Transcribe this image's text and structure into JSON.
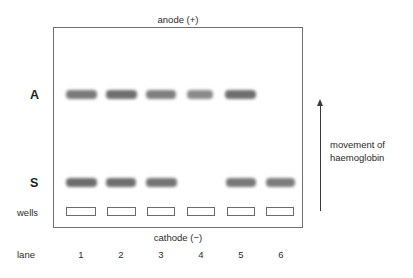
{
  "figure": {
    "type": "gel-electrophoresis-diagram",
    "anode_label": "anode (+)",
    "cathode_label": "cathode (−)",
    "wells_label": "wells",
    "lane_label": "lane",
    "row_labels": {
      "a": "A",
      "s": "S"
    },
    "movement_arrow": {
      "line1": "movement of",
      "line2": "haemoglobin",
      "direction": "up"
    },
    "lane_numbers": [
      "1",
      "2",
      "3",
      "4",
      "5",
      "6"
    ],
    "colors": {
      "band": "#848484",
      "band_dark": "#6e6e6e",
      "box_border": "#6f6f6f",
      "well_border": "#6b6b6b",
      "text": "#2e2a28",
      "arrow": "#3a3a3a",
      "background": "#ffffff"
    }
  },
  "chart_data": {
    "type": "table",
    "xlabel": "lane",
    "ylabel": "movement of haemoglobin",
    "categories": [
      "1",
      "2",
      "3",
      "4",
      "5",
      "6"
    ],
    "rows": [
      "A",
      "S",
      "wells"
    ],
    "series": [
      {
        "name": "A",
        "values": [
          1,
          1,
          1,
          1,
          1,
          0
        ]
      },
      {
        "name": "S",
        "values": [
          1,
          1,
          1,
          0,
          1,
          1
        ]
      },
      {
        "name": "wells",
        "values": [
          1,
          1,
          1,
          1,
          1,
          1
        ]
      }
    ],
    "annotations": [
      "anode (+) at top",
      "cathode (−) at bottom",
      "movement of haemoglobin is upward"
    ],
    "grid": false,
    "legend": "none"
  },
  "geometry": {
    "lane_centers": [
      81,
      121,
      161,
      201,
      241,
      281
    ],
    "band_row_a_top": 90,
    "band_row_s_top": 178,
    "well_top": 207,
    "band_width_default": 30,
    "bands_a": [
      {
        "lane": 1,
        "x": 66,
        "w": 31,
        "color": "#7a7a7a"
      },
      {
        "lane": 2,
        "x": 106,
        "w": 31,
        "color": "#6e6e6e"
      },
      {
        "lane": 3,
        "x": 146,
        "w": 30,
        "color": "#7f7f7f"
      },
      {
        "lane": 4,
        "x": 187,
        "w": 26,
        "color": "#8a8a8a"
      },
      {
        "lane": 5,
        "x": 225,
        "w": 31,
        "color": "#6f6f6f"
      }
    ],
    "bands_s": [
      {
        "lane": 1,
        "x": 66,
        "w": 31,
        "color": "#6c6c6c"
      },
      {
        "lane": 2,
        "x": 106,
        "w": 30,
        "color": "#6e6e6e"
      },
      {
        "lane": 3,
        "x": 146,
        "w": 31,
        "color": "#747474"
      },
      {
        "lane": 5,
        "x": 226,
        "w": 30,
        "color": "#787878"
      },
      {
        "lane": 6,
        "x": 266,
        "w": 29,
        "color": "#7c7c7c"
      }
    ],
    "wells": [
      {
        "lane": 1,
        "x": 66,
        "w": 30
      },
      {
        "lane": 2,
        "x": 107,
        "w": 29
      },
      {
        "lane": 3,
        "x": 147,
        "w": 28
      },
      {
        "lane": 4,
        "x": 187,
        "w": 28
      },
      {
        "lane": 5,
        "x": 227,
        "w": 28
      },
      {
        "lane": 6,
        "x": 266,
        "w": 28
      }
    ]
  }
}
